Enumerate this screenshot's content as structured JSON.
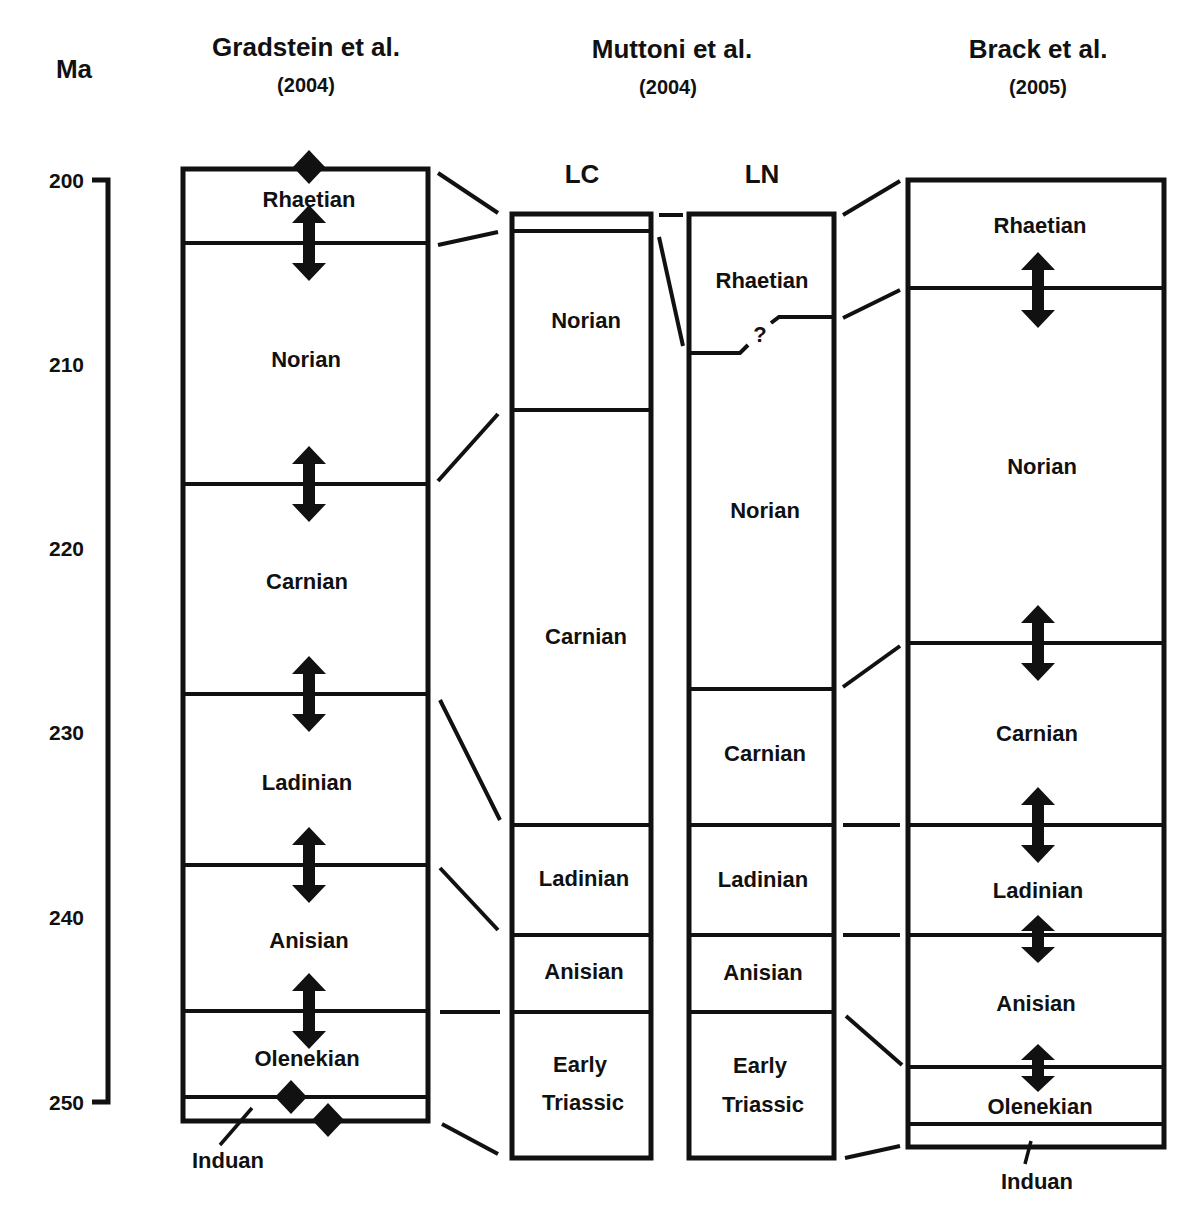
{
  "axis": {
    "unit_label": "Ma",
    "ticks": [
      {
        "label": "200",
        "y": 180
      },
      {
        "label": "210",
        "y": 364
      },
      {
        "label": "220",
        "y": 548
      },
      {
        "label": "230",
        "y": 732
      },
      {
        "label": "240",
        "y": 917
      },
      {
        "label": "250",
        "y": 1102
      }
    ]
  },
  "columns": {
    "gradstein": {
      "title": "Gradstein et al.",
      "year": "(2004)",
      "stages": [
        "Rhaetian",
        "Norian",
        "Carnian",
        "Ladinian",
        "Anisian",
        "Olenekian",
        "Induan"
      ]
    },
    "muttoni": {
      "title": "Muttoni et al.",
      "year": "(2004)",
      "lc": {
        "label": "LC",
        "stages": [
          "Norian",
          "Carnian",
          "Ladinian",
          "Anisian",
          "Early",
          "Triassic"
        ]
      },
      "ln": {
        "label": "LN",
        "stages": [
          "Rhaetian",
          "Norian",
          "Carnian",
          "Ladinian",
          "Anisian",
          "Early",
          "Triassic"
        ],
        "uncertain_mark": "?"
      }
    },
    "brack": {
      "title": "Brack et al.",
      "year": "(2005)",
      "stages": [
        "Rhaetian",
        "Norian",
        "Carnian",
        "Ladinian",
        "Anisian",
        "Olenekian",
        "Induan"
      ]
    }
  },
  "symbols": {
    "arrow": "double-headed arrow = boundary age uncertainty",
    "diamond": "diamond = radiometrically dated boundary"
  }
}
